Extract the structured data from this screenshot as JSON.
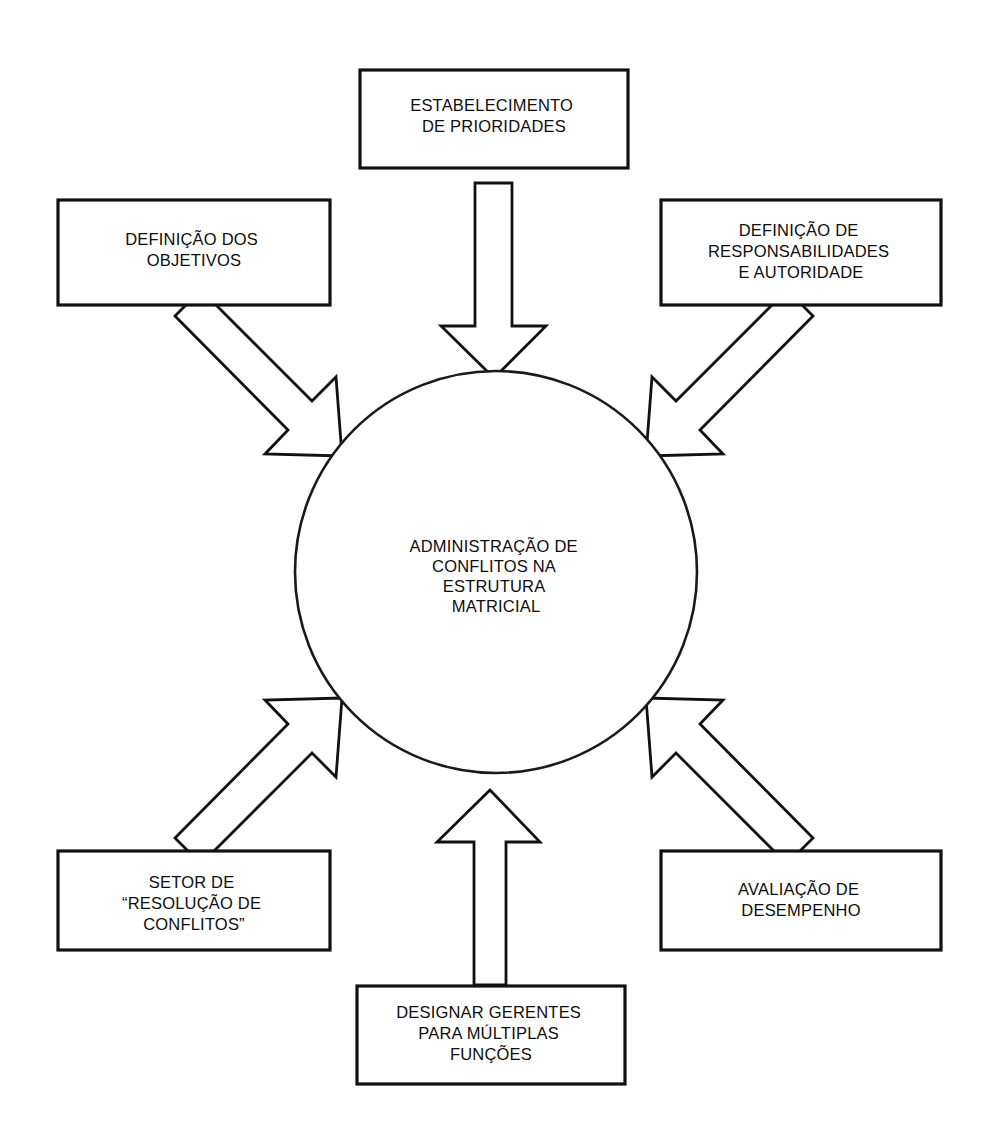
{
  "diagram": {
    "title": "ADMINISTRAÇÃO DE CONFLITOS NA ESTRUTURA MATRICIAL",
    "center": {
      "id": "center-circle",
      "lines": [
        "ADMINISTRAÇÃO DE",
        "CONFLITOS NA",
        "ESTRUTURA",
        "MATRICIAL"
      ]
    },
    "nodes": [
      {
        "id": "estabelecimento-de-prioridades",
        "position": "top",
        "lines": [
          "ESTABELECIMENTO",
          "DE PRIORIDADES"
        ]
      },
      {
        "id": "definicao-dos-objetivos",
        "position": "top-left",
        "lines": [
          "DEFINIÇÃO DOS",
          "OBJETIVOS"
        ]
      },
      {
        "id": "definicao-de-responsabilidades-e-autoridade",
        "position": "top-right",
        "lines": [
          "DEFINIÇÃO DE",
          "RESPONSABILIDADES",
          "E AUTORIDADE"
        ]
      },
      {
        "id": "setor-de-resolucao-de-conflitos",
        "position": "bottom-left",
        "lines": [
          "SETOR DE",
          "“RESOLUÇÃO DE",
          "CONFLITOS”"
        ]
      },
      {
        "id": "avaliacao-de-desempenho",
        "position": "bottom-right",
        "lines": [
          "AVALIAÇÃO DE",
          "DESEMPENHO"
        ]
      },
      {
        "id": "designar-gerentes-para-multiplas-funcoes",
        "position": "bottom",
        "lines": [
          "DESIGNAR GERENTES",
          "PARA MÚLTIPLAS",
          "FUNÇÕES"
        ]
      }
    ],
    "arrows": [
      {
        "id": "arrow-top-down",
        "from": "estabelecimento-de-prioridades",
        "to": "center-circle",
        "direction": "down"
      },
      {
        "id": "arrow-top-left-diagonal",
        "from": "definicao-dos-objetivos",
        "to": "center-circle",
        "direction": "down-right"
      },
      {
        "id": "arrow-top-right-diagonal",
        "from": "definicao-de-responsabilidades-e-autoridade",
        "to": "center-circle",
        "direction": "down-left"
      },
      {
        "id": "arrow-bottom-left-diagonal",
        "from": "setor-de-resolucao-de-conflitos",
        "to": "center-circle",
        "direction": "up-right"
      },
      {
        "id": "arrow-bottom-right-diagonal",
        "from": "avaliacao-de-desempenho",
        "to": "center-circle",
        "direction": "up-left"
      },
      {
        "id": "arrow-bottom-up",
        "from": "designar-gerentes-para-multiplas-funcoes",
        "to": "center-circle",
        "direction": "up"
      }
    ],
    "colors": {
      "stroke": "#111111",
      "fill": "#ffffff",
      "text": "#0d0d0d"
    }
  }
}
